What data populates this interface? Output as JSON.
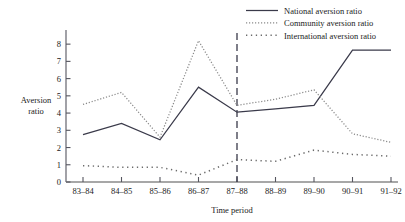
{
  "chart_data": {
    "type": "line",
    "title": "",
    "xlabel": "Time period",
    "ylabel_line1": "Aversion",
    "ylabel_line2": "ratio",
    "categories": [
      "83–84",
      "84–85",
      "85–86",
      "86–87",
      "87–88",
      "88–89",
      "89–90",
      "90–91",
      "91–92"
    ],
    "ylim": [
      0,
      8.6
    ],
    "yticks": [
      0,
      1,
      2,
      3,
      4,
      5,
      6,
      7,
      8
    ],
    "ytick_labels": [
      "0",
      "1",
      "2",
      "3",
      "4",
      "5",
      "6",
      "7",
      "8"
    ],
    "grid": false,
    "legend_position": "top-right",
    "annotations": [
      {
        "name": "vertical-divider",
        "type": "vline",
        "at_category": "87–88",
        "style": "dashed"
      }
    ],
    "series": [
      {
        "name": "National aversion ratio",
        "style": "solid",
        "color": "#3a3a4a",
        "values": [
          2.75,
          3.4,
          2.45,
          5.5,
          4.05,
          4.25,
          4.45,
          7.65,
          7.65
        ]
      },
      {
        "name": "Community aversion ratio",
        "style": "dotted-fine",
        "color": "#8a8a8a",
        "values": [
          4.5,
          5.2,
          2.6,
          8.2,
          4.45,
          4.8,
          5.35,
          2.8,
          2.3
        ]
      },
      {
        "name": "International aversion ratio",
        "style": "dotted-coarse",
        "color": "#6a6a6a",
        "values": [
          0.95,
          0.85,
          0.85,
          0.4,
          1.3,
          1.2,
          1.85,
          1.6,
          1.5
        ]
      }
    ]
  }
}
